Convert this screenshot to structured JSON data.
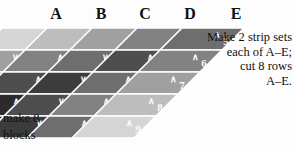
{
  "headers": {
    "label": "strip-set-column-headers",
    "items": [
      {
        "label": "A",
        "x": 56
      },
      {
        "label": "B",
        "x": 101
      },
      {
        "label": "C",
        "x": 145
      },
      {
        "label": "D",
        "x": 190
      },
      {
        "label": "E",
        "x": 236
      }
    ]
  },
  "notes": {
    "right": {
      "line1": "Make 2 strip sets",
      "line2": "each of A–E;",
      "line3": "cut 8 rows",
      "line4": "A–E."
    },
    "left": {
      "line1": "make 8",
      "line2": "blocks"
    }
  },
  "colors": {
    "background": "#fdfdfd",
    "outline": "#3a3a3a",
    "seam": "#ffffff",
    "number_text": "#ffffff",
    "heading_text": "#111111",
    "value_1": "#1d1d1d",
    "value_2": "#2b2b2b",
    "value_3": "#3c3c3c",
    "value_4": "#4e4e4e",
    "value_5": "#6e6e6e",
    "value_6": "#828282",
    "value_7": "#a0a0a0",
    "value_8": "#bdbdbd",
    "value_9": "#d5d5d5"
  },
  "chart_data": {
    "type": "table",
    "xlabel": "Strip set",
    "ylabel": "Row",
    "categories": [
      "A",
      "B",
      "C",
      "D",
      "E"
    ],
    "row_labels": [
      "row 1",
      "row 2",
      "row 3",
      "row 4",
      "row 5"
    ],
    "note": "Numbers are fabric value steps, 1 = darkest through 9 = lightest.",
    "series": [
      {
        "name": "row 1",
        "values": [
          9,
          8,
          7,
          6,
          5
        ]
      },
      {
        "name": "row 2",
        "values": [
          7,
          6,
          5,
          4,
          6
        ]
      },
      {
        "name": "row 3",
        "values": [
          5,
          4,
          3,
          5,
          7
        ]
      },
      {
        "name": "row 4",
        "values": [
          3,
          2,
          4,
          6,
          8
        ]
      },
      {
        "name": "row 5",
        "values": [
          1,
          3,
          5,
          7,
          9
        ]
      }
    ]
  },
  "strip_sets": [
    {
      "id": "A",
      "cells": [
        {
          "value": 9,
          "mark": "▷"
        },
        {
          "value": 7,
          "mark": "∨"
        },
        {
          "value": 5,
          "mark": "∨"
        },
        {
          "value": 3,
          "mark": "∨"
        },
        {
          "value": 1,
          "mark": "∨"
        }
      ]
    },
    {
      "id": "B",
      "cells": [
        {
          "value": 8,
          "mark": "▷"
        },
        {
          "value": 6,
          "mark": "∧"
        },
        {
          "value": 4,
          "mark": "∧"
        },
        {
          "value": 2,
          "mark": "∧"
        },
        {
          "value": 1,
          "mark": "∧"
        }
      ]
    },
    {
      "id": "C",
      "cells": [
        {
          "value": 7,
          "mark": "▷"
        },
        {
          "value": 5,
          "mark": "∨"
        },
        {
          "value": 3,
          "mark": "∨"
        },
        {
          "value": 4,
          "mark": "∨"
        },
        {
          "value": 3,
          "mark": "∨"
        }
      ]
    },
    {
      "id": "D",
      "cells": [
        {
          "value": 6,
          "mark": "▷"
        },
        {
          "value": 4,
          "mark": "∧"
        },
        {
          "value": 5,
          "mark": "∧"
        },
        {
          "value": 6,
          "mark": "∧"
        },
        {
          "value": 5,
          "mark": "∧"
        }
      ]
    },
    {
      "id": "E",
      "cells": [
        {
          "value": 5,
          "mark": "∧"
        },
        {
          "value": 6,
          "mark": "∧"
        },
        {
          "value": 7,
          "mark": "∧"
        },
        {
          "value": 8,
          "mark": "∧"
        },
        {
          "value": 9,
          "mark": "∧"
        }
      ]
    }
  ]
}
